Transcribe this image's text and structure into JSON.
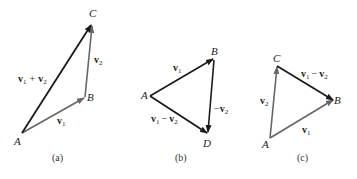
{
  "diagram": {
    "colors": {
      "dark_vector": "#1a1a1a",
      "gray_vector": "#666666"
    },
    "panels": [
      {
        "caption": "(a)",
        "points": {
          "A": "A",
          "B": "B",
          "C": "C"
        },
        "labels": {
          "sum": [
            "v",
            "1",
            "+",
            "v",
            "2"
          ],
          "v1": [
            "v",
            "1"
          ],
          "v2": [
            "v",
            "2"
          ]
        }
      },
      {
        "caption": "(b)",
        "points": {
          "A": "A",
          "B": "B",
          "D": "D"
        },
        "labels": {
          "v1": [
            "v",
            "1"
          ],
          "neg_v2": [
            "−",
            "v",
            "2"
          ],
          "diff": [
            "v",
            "1",
            "−",
            "v",
            "2"
          ]
        }
      },
      {
        "caption": "(c)",
        "points": {
          "A": "A",
          "B": "B",
          "C": "C"
        },
        "labels": {
          "v1": [
            "v",
            "1"
          ],
          "v2": [
            "v",
            "2"
          ],
          "diff": [
            "v",
            "1",
            "−",
            "v",
            "2"
          ]
        }
      }
    ]
  }
}
